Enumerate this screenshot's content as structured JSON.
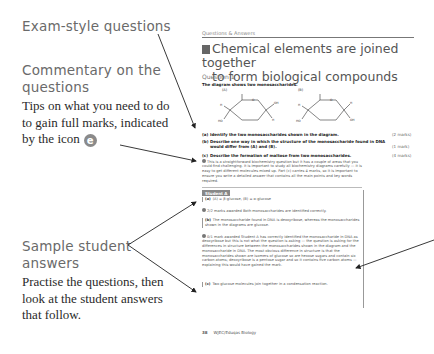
{
  "callouts": {
    "exam_heading": "Exam-style questions",
    "commentary_heading_1": "Commentary on the",
    "commentary_heading_2": "questions",
    "commentary_body_1": "Tips on what you need to do",
    "commentary_body_2": "to gain full marks, indicated",
    "commentary_body_3": "by the icon",
    "commentary_icon": "e",
    "sample_heading_1": "Sample student",
    "sample_heading_2": "answers",
    "sample_body_1": "Practise the questions, then",
    "sample_body_2": "look at the student answers",
    "sample_body_3": "that follow."
  },
  "page": {
    "running_head": "Questions & Answers",
    "title_line_1": "Chemical elements are joined together",
    "title_line_2": "to form biological compounds",
    "question_label": "Question 1",
    "stem": "The diagram shows two monosaccharides.",
    "diagram": {
      "label_a": "(A)",
      "label_b": "(B)"
    },
    "subquestions": [
      {
        "label": "(a)",
        "text": "Identify the two monosaccharides shown in the diagram.",
        "marks": "(2 marks)"
      },
      {
        "label": "(b)",
        "text": "Describe one way in which the structure of the monosaccharide found in DNA would differ from (A) and (B).",
        "marks": "(1 mark)"
      },
      {
        "label": "(c)",
        "text": "Describe the formation of maltose from two monosaccharides.",
        "marks": "(4 marks)"
      }
    ],
    "commentary": "This is a straightforward biochemistry question but it has a couple of areas that you could find challenging. It is important to study all biochemistry diagrams carefully — it is easy to get different molecules mixed up. Part (c) carries 4 marks, so it is important to ensure you write a detailed answer that contains all the main points and key words required.",
    "student_tag": "Student A",
    "answers": [
      {
        "label": "(a)",
        "text": "(A) = β-glucose, (B) = α-glucose",
        "boxed": true
      },
      {
        "label": "",
        "text": "2/2 marks awarded Both monosaccharides are identified correctly.",
        "icon": true
      },
      {
        "label": "(b)",
        "text": "The monosaccharide found in DNA is deoxyribose, whereas the monosaccharides shown in the diagrams are glucose.",
        "boxed": true
      },
      {
        "label": "",
        "text": "0/1 mark awarded Student A has correctly identified the monosaccharide in DNA as deoxyribose but this is not what the question is asking — the question is asking for the differences in structure between the monosaccharides shown in the diagram and the monosaccharide in DNA. The most obvious difference in structure is that the monosaccharides shown are isomers of glucose so are hexose sugars and contain six carbon atoms; deoxyribose is a pentose sugar and so it contains five carbon atoms — explaining this would have gained the mark.",
        "icon": true
      },
      {
        "label": "(c)",
        "text": "Two glucose molecules join together in a condensation reaction.",
        "boxed": true
      }
    ],
    "footer_page": "38",
    "footer_text": "WJEC/Eduqas Biology"
  },
  "colors": {
    "heading_grey": "#6a6a6a",
    "icon_grey": "#8a8a8a",
    "arrow": "#222222"
  }
}
